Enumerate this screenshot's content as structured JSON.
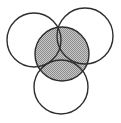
{
  "diagram": {
    "type": "venn",
    "background": "#ffffff",
    "stroke_color": "#2e2e2e",
    "shade_light": "#c8c8c8",
    "shade_dark": "#8c8c8c",
    "circles": [
      {
        "name": "top-left",
        "cx": 34,
        "cy": 40,
        "r": 27,
        "shaded": false
      },
      {
        "name": "top-right",
        "cx": 85,
        "cy": 36,
        "r": 28,
        "shaded": false
      },
      {
        "name": "bottom",
        "cx": 61,
        "cy": 87,
        "r": 27,
        "shaded": false
      },
      {
        "name": "center",
        "cx": 62,
        "cy": 54,
        "r": 27,
        "shaded": true
      }
    ]
  }
}
